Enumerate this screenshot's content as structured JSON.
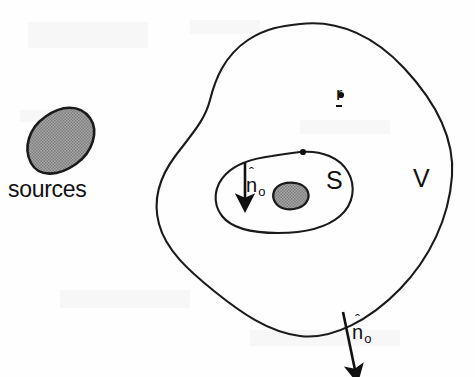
{
  "figure": {
    "background_color": "#fefefe",
    "ink_color": "#111111",
    "stipple_fill_color": "#9a9a9a"
  },
  "labels": {
    "sources": "sources",
    "surface_S": "S",
    "volume_V": "V",
    "field_point": "r",
    "field_point_dot": "•",
    "normal_symbol": "n",
    "normal_hat": "ˆ",
    "normal_subscript": "o"
  },
  "regions": [
    {
      "name": "external-sources-blob",
      "label": "sources",
      "fill": "stipple-gray",
      "outline": true
    },
    {
      "name": "outer-volume-boundary",
      "label": "V",
      "fill": "none",
      "outline": true
    },
    {
      "name": "inner-surface-boundary",
      "label": "S",
      "fill": "none",
      "outline": true
    },
    {
      "name": "internal-source-blob",
      "label": "",
      "fill": "stipple-gray",
      "outline": true
    }
  ],
  "arrows": [
    {
      "name": "inner-normal-arrow",
      "label": "n̂o",
      "direction": "down",
      "from": "inner surface boundary top edge"
    },
    {
      "name": "outer-normal-arrow",
      "label": "n̂o",
      "direction": "down-outward",
      "from": "outer volume boundary bottom edge"
    }
  ],
  "markers": [
    {
      "name": "field-point-marker",
      "label": "r",
      "underlined": true
    },
    {
      "name": "inner-boundary-dot",
      "label": ""
    }
  ]
}
